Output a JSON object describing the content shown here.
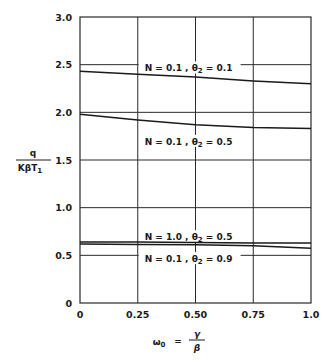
{
  "chart_data": {
    "type": "line",
    "title": "",
    "xlabel": "ω0 = γ/β",
    "ylabel": "q / (KβT1)",
    "xlim": [
      0,
      1.0
    ],
    "ylim": [
      0,
      3.0
    ],
    "grid": true,
    "x_ticks": [
      "0",
      "0.25",
      "0.50",
      "0.75",
      "1.0"
    ],
    "x_tick_values": [
      0,
      0.25,
      0.5,
      0.75,
      1.0
    ],
    "y_ticks": [
      "0",
      "0.5",
      "1.0",
      "1.5",
      "2.0",
      "2.5",
      "3.0"
    ],
    "y_tick_values": [
      0,
      0.5,
      1.0,
      1.5,
      2.0,
      2.5,
      3.0
    ],
    "legend_position": "inline labels",
    "series": [
      {
        "name": "N = 0.1 , θ2 = 0.1",
        "x": [
          0,
          0.25,
          0.5,
          0.75,
          1.0
        ],
        "values": [
          2.43,
          2.4,
          2.37,
          2.33,
          2.3
        ],
        "label_pos": {
          "x": 0.47,
          "y": 2.46
        }
      },
      {
        "name": "N = 0.1 , θ2 = 0.5",
        "x": [
          0,
          0.25,
          0.5,
          0.75,
          1.0
        ],
        "values": [
          1.98,
          1.92,
          1.87,
          1.84,
          1.83
        ],
        "label_pos": {
          "x": 0.47,
          "y": 1.69
        }
      },
      {
        "name": "N = 1.0 , θ2 = 0.5",
        "x": [
          0,
          0.25,
          0.5,
          0.75,
          1.0
        ],
        "values": [
          0.64,
          0.64,
          0.635,
          0.63,
          0.63
        ],
        "label_pos": {
          "x": 0.47,
          "y": 0.69
        }
      },
      {
        "name": "N = 0.1 , θ2 = 0.9",
        "x": [
          0,
          0.25,
          0.5,
          0.75,
          1.0
        ],
        "values": [
          0.62,
          0.615,
          0.61,
          0.6,
          0.575
        ],
        "label_pos": {
          "x": 0.47,
          "y": 0.46
        }
      }
    ]
  },
  "labels": {
    "ylabel_num": "q",
    "ylabel_den": "KβT",
    "ylabel_den_sub": "1",
    "xlabel_main": "ω",
    "xlabel_sub": "0",
    "xlabel_eq": "=",
    "xlabel_num": "γ",
    "xlabel_den": "β"
  },
  "colors": {
    "line": "#1a1a1a",
    "grid": "#2a2a2a",
    "background": "#ffffff"
  }
}
